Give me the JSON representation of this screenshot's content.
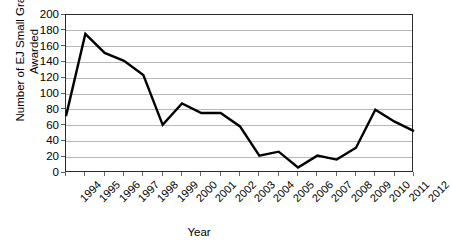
{
  "chart_data": {
    "type": "line",
    "title": "",
    "xlabel": "Year",
    "ylabel": "Number of EJ Small Grants Awarded",
    "ylabel_lines": [
      "Number of EJ Small Grants",
      "Awarded"
    ],
    "categories": [
      "1994",
      "1995",
      "1996",
      "1997",
      "1998",
      "1999",
      "2000",
      "2001",
      "2002",
      "2003",
      "2004",
      "2005",
      "2006",
      "2007",
      "2008",
      "2009",
      "2010",
      "2011",
      "2012"
    ],
    "values": [
      72,
      176,
      152,
      142,
      124,
      61,
      88,
      76,
      76,
      59,
      22,
      27,
      7,
      22,
      17,
      32,
      80,
      65,
      53
    ],
    "ylim": [
      0,
      200
    ],
    "yticks": [
      0,
      20,
      40,
      60,
      80,
      100,
      120,
      140,
      160,
      180,
      200
    ],
    "ytick_labels": [
      "0",
      "20",
      "40",
      "60",
      "80",
      "100",
      "120",
      "140",
      "160",
      "180",
      "200"
    ],
    "grid": true,
    "legend": false,
    "series_color": "#000000",
    "grid_color": "#b9b9b9",
    "axis_color": "#2b2b2b",
    "background": "#ffffff"
  }
}
